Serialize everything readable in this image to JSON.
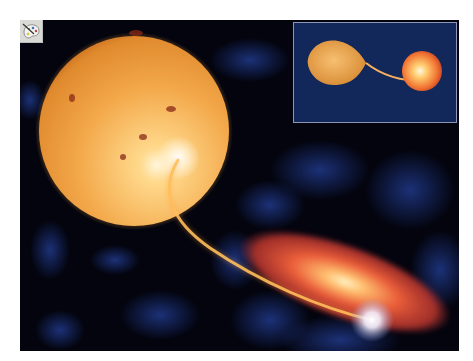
{
  "figure": {
    "icon": "palette-icon",
    "colors": {
      "space_background": "#03040e",
      "nebula_blue": "#1b2f78",
      "star_orange": "#f0a040",
      "star_highlight": "#fff3d0",
      "disk_red": "#e0483a",
      "disk_core": "#ffe8b0",
      "inset_background": "#13285a",
      "inset_border": "#8d97b5"
    },
    "main_scene": {
      "giant_star": {
        "cx": 114,
        "cy": 111,
        "r": 95
      },
      "accretion_disk": {
        "cx": 325,
        "cy": 262,
        "rx": 110,
        "ry": 38,
        "rotation_deg": 20
      },
      "hot_spot": {
        "cx": 352,
        "cy": 300
      }
    },
    "inset": {
      "description": "Roche-lobe overflow: teardrop-shaped giant star feeding a smaller companion star"
    }
  }
}
